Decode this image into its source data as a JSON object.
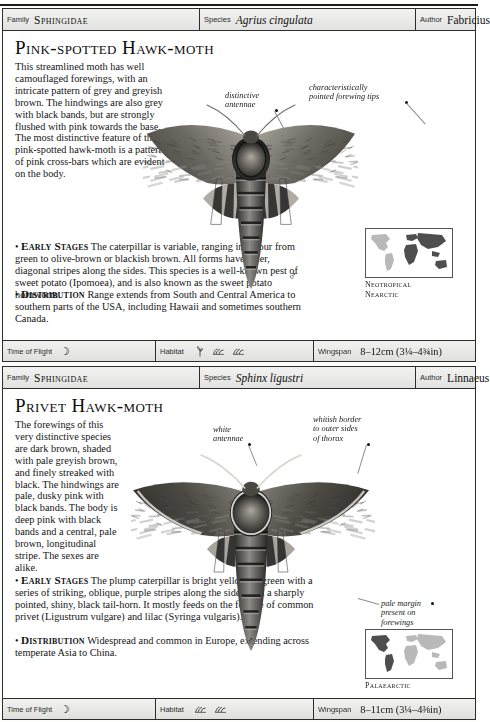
{
  "page": {
    "folio": ""
  },
  "labels": {
    "family": "Family",
    "species": "Species",
    "author": "Author",
    "time_of_flight": "Time of Flight",
    "habitat": "Habitat",
    "wingspan": "Wingspan"
  },
  "entries": [
    {
      "family": "Sphingidae",
      "species": "Agrius cingulata",
      "author": "Fabricius",
      "title": "Pink-spotted Hawk-moth",
      "description": "This streamlined moth has well camouflaged forewings, with an intricate pattern of grey and greyish brown. The hindwings are also grey with black bands, but are strongly flushed with pink towards the base. The most distinctive feature of the pink-spotted hawk-moth is a pattern of pink cross-bars which are evident on the body.",
      "early_stages_label": "Early Stages",
      "early_stages": "The caterpillar is variable, ranging in colour from green to olive-brown or blackish brown. All forms have paler, diagonal stripes along the sides. This species is a well-known pest of sweet potato (Ipomoea), and is also known as the sweet potato hornworm.",
      "early_stages_italic": "(Ipomoea)",
      "distribution_label": "Distribution",
      "distribution": "Range extends from South and Central America to southern parts of the USA, including Hawaii and sometimes southern Canada.",
      "callouts": [
        {
          "text": "distinctive\nantennae",
          "name": "callout-distinctive-antennae"
        },
        {
          "text": "characteristically\npointed forewing tips",
          "name": "callout-pointed-forewing-tips"
        }
      ],
      "sex_symbol": "♂",
      "map_caption": "Neotropical\nNearctic",
      "time_of_flight_icon": "moon-icon",
      "habitat_icons": [
        "plant-icon",
        "hill-icon",
        "hill-icon"
      ],
      "wingspan": "8–12cm (3¼–4¾in)"
    },
    {
      "family": "Sphingidae",
      "species": "Sphinx ligustri",
      "author": "Linnaeus",
      "title": "Privet Hawk-moth",
      "description": "The forewings of this very distinctive species are dark brown, shaded with pale greyish brown, and finely streaked with black. The hindwings are pale, dusky pink with black bands. The body is deep pink with black bands and a central, pale brown, longitudinal stripe. The sexes are alike.",
      "early_stages_label": "Early Stages",
      "early_stages": "The plump caterpillar is bright yellowish green with a series of striking, oblique, purple stripes along the sides, and a sharply pointed, shiny, black tail-horn. It mostly feeds on the foliage of common privet (Ligustrum vulgare) and lilac (Syringa vulgaris).",
      "early_stages_italic": "(Ligustrum vulgare)",
      "distribution_label": "Distribution",
      "distribution": "Widespread and common in Europe, extending across temperate Asia to China.",
      "callouts": [
        {
          "text": "white\nantennae",
          "name": "callout-white-antennae"
        },
        {
          "text": "whitish border\nto outer sides\nof thorax",
          "name": "callout-whitish-border-thorax"
        },
        {
          "text": "pale margin\npresent on\nforewings",
          "name": "callout-pale-margin-forewings"
        }
      ],
      "sex_symbol": "♂",
      "map_caption": "Palaearctic",
      "time_of_flight_icon": "moon-icon",
      "habitat_icons": [
        "hill-icon",
        "hill-icon"
      ],
      "wingspan": "8–11cm (3¼–4⅜in)"
    }
  ],
  "colors": {
    "rule": "#2c2c2c",
    "band_top": "#f2f2f0",
    "band_bottom": "#e0e0de",
    "map_land_dark": "#4e4e4e",
    "map_land_light": "#b9b9b9",
    "text": "#141414"
  }
}
